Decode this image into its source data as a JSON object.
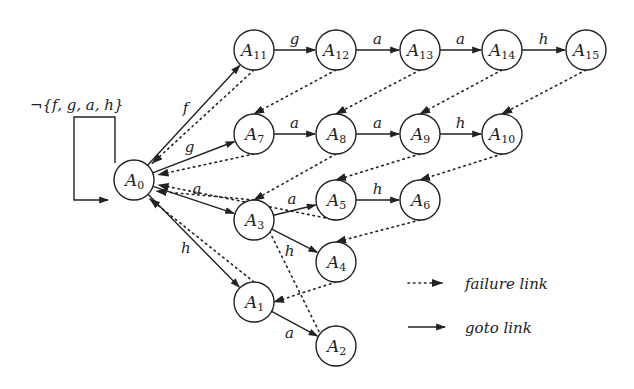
{
  "diagram": {
    "title": "",
    "self_loop_label": "¬{f, g, a, h}",
    "nodes": [
      {
        "id": "A0",
        "base": "A",
        "sub": "0",
        "x": 134,
        "y": 180
      },
      {
        "id": "A11",
        "base": "A",
        "sub": "11",
        "x": 254,
        "y": 50
      },
      {
        "id": "A12",
        "base": "A",
        "sub": "12",
        "x": 336,
        "y": 50
      },
      {
        "id": "A13",
        "base": "A",
        "sub": "13",
        "x": 420,
        "y": 50
      },
      {
        "id": "A14",
        "base": "A",
        "sub": "14",
        "x": 502,
        "y": 50
      },
      {
        "id": "A15",
        "base": "A",
        "sub": "15",
        "x": 586,
        "y": 50
      },
      {
        "id": "A7",
        "base": "A",
        "sub": "7",
        "x": 254,
        "y": 134
      },
      {
        "id": "A8",
        "base": "A",
        "sub": "8",
        "x": 336,
        "y": 134
      },
      {
        "id": "A9",
        "base": "A",
        "sub": "9",
        "x": 420,
        "y": 134
      },
      {
        "id": "A10",
        "base": "A",
        "sub": "10",
        "x": 502,
        "y": 134
      },
      {
        "id": "A3",
        "base": "A",
        "sub": "3",
        "x": 254,
        "y": 220
      },
      {
        "id": "A5",
        "base": "A",
        "sub": "5",
        "x": 336,
        "y": 200
      },
      {
        "id": "A6",
        "base": "A",
        "sub": "6",
        "x": 420,
        "y": 200
      },
      {
        "id": "A4",
        "base": "A",
        "sub": "4",
        "x": 336,
        "y": 262
      },
      {
        "id": "A1",
        "base": "A",
        "sub": "1",
        "x": 254,
        "y": 302
      },
      {
        "id": "A2",
        "base": "A",
        "sub": "2",
        "x": 336,
        "y": 346
      }
    ],
    "goto_edges": [
      {
        "from": "A0",
        "to": "A11",
        "label": "f"
      },
      {
        "from": "A11",
        "to": "A12",
        "label": "g"
      },
      {
        "from": "A12",
        "to": "A13",
        "label": "a"
      },
      {
        "from": "A13",
        "to": "A14",
        "label": "a"
      },
      {
        "from": "A14",
        "to": "A15",
        "label": "h"
      },
      {
        "from": "A0",
        "to": "A7",
        "label": "g"
      },
      {
        "from": "A7",
        "to": "A8",
        "label": "a"
      },
      {
        "from": "A8",
        "to": "A9",
        "label": "a"
      },
      {
        "from": "A9",
        "to": "A10",
        "label": "h"
      },
      {
        "from": "A0",
        "to": "A3",
        "label": "a"
      },
      {
        "from": "A3",
        "to": "A5",
        "label": "a"
      },
      {
        "from": "A5",
        "to": "A6",
        "label": "h"
      },
      {
        "from": "A3",
        "to": "A4",
        "label": "h"
      },
      {
        "from": "A0",
        "to": "A1",
        "label": "h"
      },
      {
        "from": "A1",
        "to": "A2",
        "label": "a"
      }
    ],
    "failure_edges": [
      {
        "from": "A11",
        "to": "A0"
      },
      {
        "from": "A12",
        "to": "A7"
      },
      {
        "from": "A7",
        "to": "A0"
      },
      {
        "from": "A13",
        "to": "A8"
      },
      {
        "from": "A14",
        "to": "A9"
      },
      {
        "from": "A15",
        "to": "A10"
      },
      {
        "from": "A8",
        "to": "A3"
      },
      {
        "from": "A5",
        "to": "A0"
      },
      {
        "from": "A9",
        "to": "A5"
      },
      {
        "from": "A10",
        "to": "A6"
      },
      {
        "from": "A6",
        "to": "A4"
      },
      {
        "from": "A3",
        "to": "A0"
      },
      {
        "from": "A4",
        "to": "A1"
      },
      {
        "from": "A1",
        "to": "A0"
      },
      {
        "from": "A2",
        "to": "A3"
      }
    ],
    "legend": {
      "failure_label": "failure link",
      "goto_label": "goto link"
    }
  }
}
